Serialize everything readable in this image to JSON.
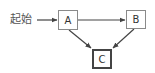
{
  "diagram": {
    "type": "flow",
    "start_label": "起始",
    "nodes": [
      {
        "id": "A",
        "label": "A"
      },
      {
        "id": "B",
        "label": "B"
      },
      {
        "id": "C",
        "label": "C",
        "emphasized": true
      }
    ],
    "edges": [
      {
        "from": "起始",
        "to": "A"
      },
      {
        "from": "A",
        "to": "B"
      },
      {
        "from": "A",
        "to": "C"
      },
      {
        "from": "B",
        "to": "C"
      }
    ]
  },
  "colors": {
    "edge": "#444444",
    "node_border": "#8a8a8a",
    "emphasized_border": "#444444",
    "text": "#555555"
  }
}
